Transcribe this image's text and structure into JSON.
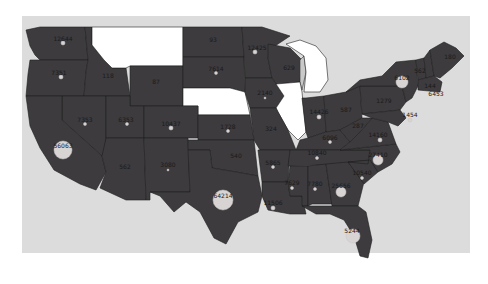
{
  "map": {
    "type": "choropleth-bubble",
    "region": "United States (contiguous)",
    "colors": {
      "background": "#ffffff",
      "panel": "#dcdcdc",
      "state_fill": "#3d3b3e",
      "no_data_fill": "#ffffff",
      "marker": "#d8d4d4"
    },
    "no_data_states": [
      "MT",
      "NE",
      "IL",
      "MI"
    ],
    "states": [
      {
        "id": "WA",
        "label": "12644"
      },
      {
        "id": "OR",
        "label": "7351"
      },
      {
        "id": "ID",
        "label": "118"
      },
      {
        "id": "WY",
        "label": "87"
      },
      {
        "id": "ND",
        "label": "93"
      },
      {
        "id": "SD",
        "label": "7614"
      },
      {
        "id": "MN",
        "label": "12425"
      },
      {
        "id": "WI",
        "label": "629"
      },
      {
        "id": "IA",
        "label": "2140"
      },
      {
        "id": "NV",
        "label": "7353"
      },
      {
        "id": "UT",
        "label": "6353"
      },
      {
        "id": "CO",
        "label": "10437"
      },
      {
        "id": "KS",
        "label": "1728"
      },
      {
        "id": "MO",
        "label": "324"
      },
      {
        "id": "CA",
        "label": "56063"
      },
      {
        "id": "AZ",
        "label": "562"
      },
      {
        "id": "NM",
        "label": "3080"
      },
      {
        "id": "OK",
        "label": "540"
      },
      {
        "id": "TX",
        "label": "64214"
      },
      {
        "id": "AR",
        "label": "5865"
      },
      {
        "id": "LA",
        "label": "11506"
      },
      {
        "id": "IN",
        "label": "14426"
      },
      {
        "id": "OH",
        "label": "587"
      },
      {
        "id": "KY",
        "label": "6096"
      },
      {
        "id": "TN",
        "label": "10840"
      },
      {
        "id": "MS",
        "label": "7629"
      },
      {
        "id": "AL",
        "label": "7780"
      },
      {
        "id": "GA",
        "label": "25656"
      },
      {
        "id": "FL",
        "label": "5244"
      },
      {
        "id": "SC",
        "label": "10540"
      },
      {
        "id": "NC",
        "label": "27410"
      },
      {
        "id": "VA",
        "label": "14160"
      },
      {
        "id": "WV",
        "label": "287"
      },
      {
        "id": "PA",
        "label": "1279"
      },
      {
        "id": "NY",
        "label": "6102"
      },
      {
        "id": "VT",
        "label": "562"
      },
      {
        "id": "NH",
        "label": "144"
      },
      {
        "id": "MA",
        "label": "6453"
      },
      {
        "id": "ME",
        "label": "180"
      },
      {
        "id": "MD",
        "label": "1454"
      }
    ]
  }
}
